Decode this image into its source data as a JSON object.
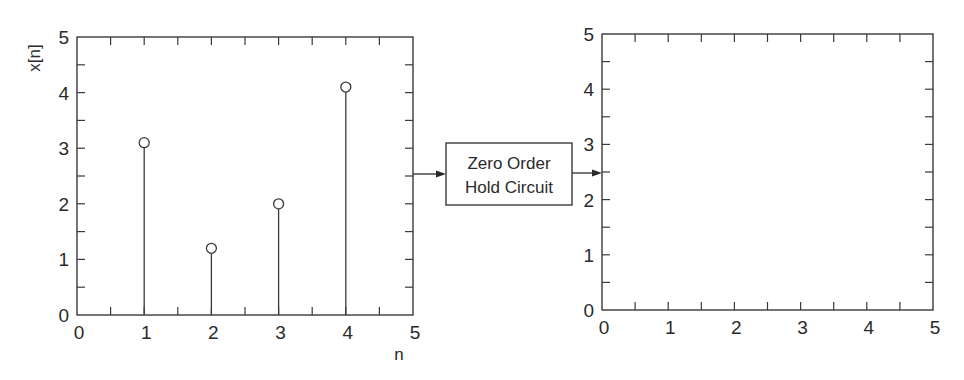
{
  "chart_data": [
    {
      "type": "stem",
      "title": "",
      "xlabel": "n",
      "ylabel": "x[n]",
      "xlim": [
        0,
        5
      ],
      "ylim": [
        0,
        5
      ],
      "xticks": [
        0,
        1,
        2,
        3,
        4,
        5
      ],
      "yticks": [
        0,
        1,
        2,
        3,
        4,
        5
      ],
      "minor_tick_step": 0.5,
      "grid": false,
      "marker": "open-circle",
      "x": [
        1,
        2,
        3,
        4
      ],
      "values": [
        3.1,
        1.2,
        2.0,
        4.1
      ]
    },
    {
      "type": "empty",
      "title": "",
      "xlabel": "",
      "ylabel": "",
      "xlim": [
        0,
        5
      ],
      "ylim": [
        0,
        5
      ],
      "xticks": [
        0,
        1,
        2,
        3,
        4,
        5
      ],
      "yticks": [
        0,
        1,
        2,
        3,
        4,
        5
      ],
      "minor_tick_step": 0.5,
      "grid": false,
      "x": [],
      "values": []
    }
  ],
  "block": {
    "line1": "Zero Order",
    "line2": "Hold Circuit"
  },
  "colors": {
    "ink": "#3a3a3a",
    "background": "#ffffff"
  }
}
